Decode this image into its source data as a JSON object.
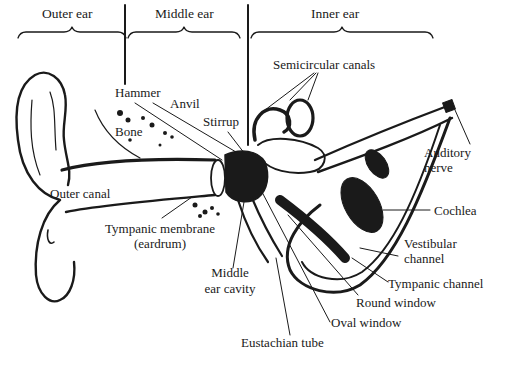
{
  "diagram": {
    "sections": [
      {
        "id": "outer",
        "label": "Outer ear"
      },
      {
        "id": "middle",
        "label": "Middle ear"
      },
      {
        "id": "inner",
        "label": "Inner ear"
      }
    ],
    "labels": {
      "hammer": "Hammer",
      "anvil": "Anvil",
      "stirrup": "Stirrup",
      "bone": "Bone",
      "semicircular_canals": "Semicircular canals",
      "auditory_nerve_1": "Auditory",
      "auditory_nerve_2": "nerve",
      "cochlea": "Cochlea",
      "vestibular_channel_1": "Vestibular",
      "vestibular_channel_2": "channel",
      "tympanic_channel": "Tympanic channel",
      "round_window": "Round window",
      "oval_window": "Oval window",
      "eustachian_tube": "Eustachian tube",
      "outer_canal": "Outer canal",
      "tympanic_membrane_1": "Tympanic membrane",
      "tympanic_membrane_2": "(eardrum)",
      "middle_ear_cavity_1": "Middle",
      "middle_ear_cavity_2": "ear cavity"
    },
    "colors": {
      "ink": "#1a1a1a",
      "background": "#ffffff"
    }
  }
}
